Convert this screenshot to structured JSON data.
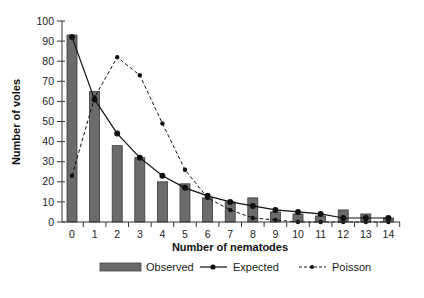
{
  "chart_data": {
    "type": "bar",
    "title": "",
    "xlabel": "Number of nematodes",
    "ylabel": "Number of voles",
    "categories": [
      "0",
      "1",
      "2",
      "3",
      "4",
      "5",
      "6",
      "7",
      "8",
      "9",
      "10",
      "11",
      "12",
      "13",
      "14"
    ],
    "ylim": [
      0,
      100
    ],
    "yticks": [
      0,
      10,
      20,
      30,
      40,
      50,
      60,
      70,
      80,
      90,
      100
    ],
    "grid": false,
    "legend_position": "bottom",
    "series": [
      {
        "name": "Observed",
        "type": "bar",
        "color": "#6b6b6b",
        "values": [
          93,
          65,
          38,
          32,
          20,
          19,
          12,
          10,
          12,
          5,
          4,
          3,
          6,
          4,
          2
        ]
      },
      {
        "name": "Expected",
        "type": "line",
        "style": "solid",
        "marker": "circle",
        "color": "#111111",
        "values": [
          92,
          61,
          44,
          32,
          23,
          17,
          13,
          10,
          8,
          6,
          5,
          4,
          2,
          2,
          2
        ]
      },
      {
        "name": "Poisson",
        "type": "line",
        "style": "dashed",
        "marker": "circle",
        "color": "#111111",
        "values": [
          23,
          62,
          82,
          73,
          49,
          26,
          12,
          6,
          2,
          1,
          0,
          0,
          0,
          0,
          0
        ]
      }
    ]
  },
  "legend": {
    "observed": "Observed",
    "expected": "Expected",
    "poisson": "Poisson"
  }
}
